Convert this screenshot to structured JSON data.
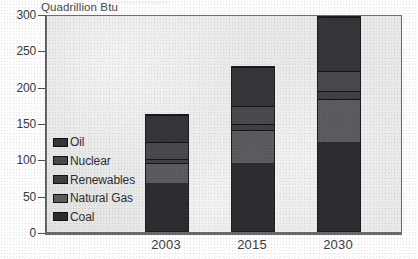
{
  "figure": {
    "title_remnant": "........................",
    "unit_label": "Quadrillion Btu"
  },
  "chart_data": {
    "type": "bar",
    "stacked": true,
    "title": "",
    "subtitle": "",
    "xlabel": "",
    "ylabel": "Quadrillion Btu",
    "ylim": [
      0,
      300
    ],
    "yticks": [
      0,
      50,
      100,
      150,
      200,
      250,
      300
    ],
    "ytick_labels": [
      "0",
      "50",
      "100",
      "150",
      "200",
      "250",
      "300"
    ],
    "grid": false,
    "legend_position": "inside-left",
    "categories": [
      "2003",
      "2015",
      "2030"
    ],
    "series": [
      {
        "name": "Coal",
        "values": [
          67,
          95,
          124
        ],
        "color": "#2d2d31"
      },
      {
        "name": "Natural Gas",
        "values": [
          28,
          46,
          60
        ],
        "color": "#5c5c60"
      },
      {
        "name": "Renewables",
        "values": [
          6,
          8,
          11
        ],
        "color": "#414145"
      },
      {
        "name": "Nuclear",
        "values": [
          23,
          25,
          27
        ],
        "color": "#4a4a4e"
      },
      {
        "name": "Oil",
        "values": [
          39,
          54,
          75
        ],
        "color": "#35353a"
      }
    ],
    "totals": [
      163,
      228,
      297
    ],
    "legend_order_displayed": [
      "Oil",
      "Nuclear",
      "Renewables",
      "Natural Gas",
      "Coal"
    ]
  }
}
